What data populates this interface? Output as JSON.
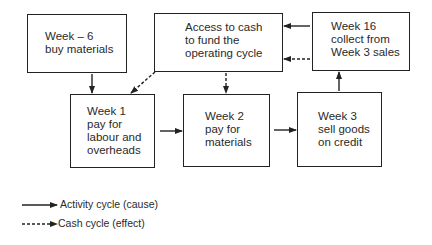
{
  "diagram": {
    "nodes": [
      {
        "id": "week_minus6",
        "lines": [
          "Week – 6",
          "buy materials"
        ]
      },
      {
        "id": "access_cash",
        "lines": [
          "Access to cash",
          "to fund the",
          "operating cycle"
        ]
      },
      {
        "id": "week16",
        "lines": [
          "Week 16",
          "collect from",
          "Week 3 sales"
        ]
      },
      {
        "id": "week1",
        "lines": [
          "Week 1",
          "pay for",
          "labour and",
          "overheads"
        ]
      },
      {
        "id": "week2",
        "lines": [
          "Week 2",
          "pay for",
          "materials"
        ]
      },
      {
        "id": "week3",
        "lines": [
          "Week 3",
          "sell goods",
          "on credit"
        ]
      }
    ],
    "edges": [
      {
        "from": "week_minus6",
        "to": "week1",
        "style": "solid"
      },
      {
        "from": "access_cash",
        "to": "week1",
        "style": "dashed"
      },
      {
        "from": "access_cash",
        "to": "week2",
        "style": "dashed"
      },
      {
        "from": "week1",
        "to": "week2",
        "style": "solid"
      },
      {
        "from": "week2",
        "to": "week3",
        "style": "solid"
      },
      {
        "from": "week3",
        "to": "week16",
        "style": "solid"
      },
      {
        "from": "week16",
        "to": "access_cash",
        "style": "solid"
      },
      {
        "from": "week16",
        "to": "access_cash",
        "style": "dashed"
      }
    ]
  },
  "legend": {
    "items": [
      {
        "style": "solid",
        "label": "Activity cycle (cause)"
      },
      {
        "style": "dashed",
        "label": "Cash cycle (effect)"
      }
    ]
  }
}
